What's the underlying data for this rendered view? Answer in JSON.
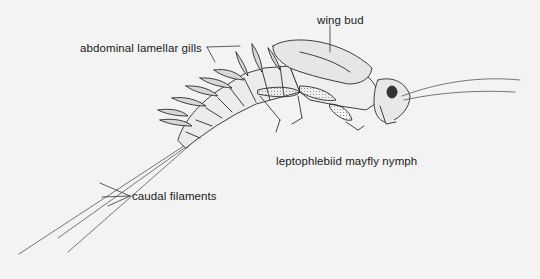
{
  "figure": {
    "title": "leptophlebiid mayfly nymph",
    "background": "#f3f3f3",
    "line_color": "#2a2a2a"
  },
  "labels": {
    "wing_bud": "wing bud",
    "abdominal_gills": "abdominal lamellar gills",
    "caudal_filaments": "caudal filaments"
  }
}
